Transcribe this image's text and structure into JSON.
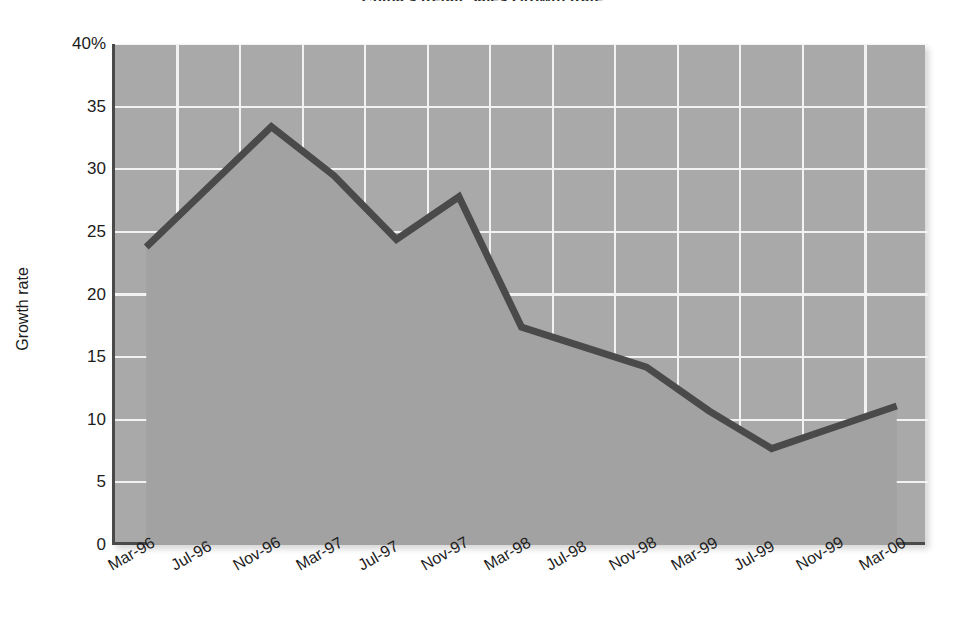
{
  "chart": {
    "title": "China's Retail Sales Growth Rate",
    "ylabel": "Growth rate"
  },
  "chart_data": {
    "type": "area",
    "title": "China's Retail Sales Growth Rate",
    "xlabel": "",
    "ylabel": "Growth rate",
    "ylim": [
      0,
      40
    ],
    "yticks": [
      0,
      5,
      10,
      15,
      20,
      25,
      30,
      35,
      40
    ],
    "ytick_labels": [
      "0",
      "5",
      "10",
      "15",
      "20",
      "25",
      "30",
      "35",
      "40%"
    ],
    "grid": true,
    "grid_color": "#f2f2f2",
    "legend": "none",
    "plot_background": "#a9a9a9",
    "line_color": "#4a4a4a",
    "categories": [
      "Mar-96",
      "Jul-96",
      "Nov-96",
      "Mar-97",
      "Jul-97",
      "Nov-97",
      "Mar-98",
      "Jul-98",
      "Nov-98",
      "Mar-99",
      "Jul-99",
      "Nov-99",
      "Mar-00"
    ],
    "values": [
      23.8,
      28.6,
      33.4,
      29.5,
      24.4,
      27.8,
      17.4,
      15.8,
      14.2,
      10.7,
      7.7,
      9.4,
      11.1
    ],
    "series": [
      {
        "name": "Growth rate",
        "values": [
          23.8,
          28.6,
          33.4,
          29.5,
          24.4,
          27.8,
          17.4,
          15.8,
          14.2,
          10.7,
          7.7,
          9.4,
          11.1
        ]
      }
    ],
    "annotations": []
  }
}
